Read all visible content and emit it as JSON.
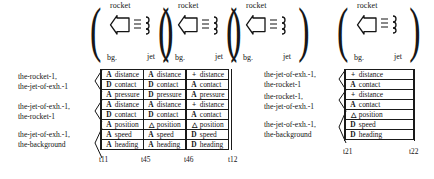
{
  "figure": {
    "icon_groups_left": [
      {
        "top_label": "rocket",
        "bottom_left_label": "bg.",
        "bottom_right_label": "jet",
        "body_icon": "rocket-arrow-icon",
        "exhaust_icon": "exhaust-lines-icon"
      },
      {
        "top_label": "rocket",
        "bottom_left_label": "bg.",
        "bottom_right_label": "jet",
        "body_icon": "rocket-arrow-icon",
        "exhaust_icon": "exhaust-lines-icon"
      },
      {
        "top_label": "rocket",
        "bottom_left_label": "bg.",
        "bottom_right_label": "jet",
        "body_icon": "rocket-arrow-icon",
        "exhaust_icon": "exhaust-lines-icon"
      }
    ],
    "icon_groups_right": [
      {
        "top_label": "rocket",
        "bottom_left_label": "bg.",
        "bottom_right_label": "jet",
        "body_icon": "rocket-arrow-icon",
        "exhaust_icon": "exhaust-lines-icon"
      }
    ],
    "left_panel": {
      "row_labels": [
        "the-rocket-1,\nthe-jet-of-exh.-1",
        "the-jet-of-exh.-1,\nthe-rocket-1",
        "the-jet-of-exh.-1,\nthe-background"
      ],
      "row_labels_flat": [
        {
          "line1": "the-rocket-1,",
          "line2": "the-jet-of-exh.-1"
        },
        {
          "line1": "the-jet-of-exh.-1,",
          "line2": "the-rocket-1"
        },
        {
          "line1": "the-jet-of-exh.-1,",
          "line2": "the-background"
        }
      ],
      "columns": [
        {
          "tick": "t11",
          "cells": [
            {
              "op": "A",
              "name": "distance"
            },
            {
              "op": "D",
              "name": "contact"
            },
            {
              "op": "A",
              "name": "pressure"
            },
            {
              "op": "A",
              "name": "distance"
            },
            {
              "op": "D",
              "name": "contact"
            },
            {
              "op": "A",
              "name": "position"
            },
            {
              "op": "A",
              "name": "speed"
            },
            {
              "op": "A",
              "name": "heading"
            }
          ]
        },
        {
          "tick": "t45",
          "cells": [
            {
              "op": "A",
              "name": "distance"
            },
            {
              "op": "D",
              "name": "contact"
            },
            {
              "op": "D",
              "name": "pressure"
            },
            {
              "op": "A",
              "name": "distance"
            },
            {
              "op": "D",
              "name": "contact"
            },
            {
              "op": "△",
              "name": "position"
            },
            {
              "op": "A",
              "name": "speed"
            },
            {
              "op": "A",
              "name": "heading"
            }
          ]
        },
        {
          "tick": "t46",
          "cells": [
            {
              "op": "+",
              "name": "distance"
            },
            {
              "op": "A",
              "name": "contact"
            },
            {
              "op": "A",
              "name": "pressure"
            },
            {
              "op": "+",
              "name": "distance"
            },
            {
              "op": "A",
              "name": "contact"
            },
            {
              "op": "△",
              "name": "position"
            },
            {
              "op": "D",
              "name": "speed"
            },
            {
              "op": "D",
              "name": "heading"
            }
          ]
        }
      ],
      "end_tick": "t12"
    },
    "right_panel": {
      "row_labels_flat": [
        {
          "line1": "the-jet-of-exh.-1,",
          "line2": "the-rocket-1"
        },
        {
          "line1": "the-rocket-1,",
          "line2": "the-jet-of-exh.-1"
        },
        {
          "line1": "the-jet-of-exh.-1,",
          "line2": "the-background"
        }
      ],
      "columns": [
        {
          "tick": "t21",
          "cells": [
            {
              "op": "+",
              "name": "distance"
            },
            {
              "op": "A",
              "name": "contact"
            },
            {
              "op": "+",
              "name": "distance"
            },
            {
              "op": "A",
              "name": "contact"
            },
            {
              "op": "△",
              "name": "position"
            },
            {
              "op": "D",
              "name": "speed"
            },
            {
              "op": "D",
              "name": "heading"
            }
          ]
        }
      ],
      "end_tick": "t22"
    }
  }
}
